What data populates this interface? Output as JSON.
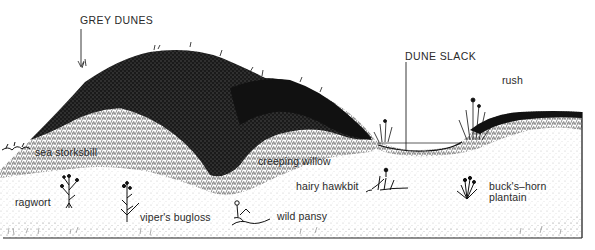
{
  "diagram": {
    "title_labels": [
      {
        "id": "grey-dunes",
        "text": "GREY DUNES"
      },
      {
        "id": "dune-slack",
        "text": "DUNE SLACK"
      }
    ],
    "plant_labels": [
      {
        "id": "rush",
        "text": "rush"
      },
      {
        "id": "sea-storksbill",
        "text": "sea storksbill"
      },
      {
        "id": "creeping-willow",
        "text": "creeping willow"
      },
      {
        "id": "ragwort",
        "text": "ragwort"
      },
      {
        "id": "hairy-hawkbit",
        "text": "hairy hawkbit"
      },
      {
        "id": "bucks-horn-plantain",
        "text": "buck's–horn",
        "text2": "plantain"
      },
      {
        "id": "vipers-bugloss",
        "text": "viper's bugloss"
      },
      {
        "id": "wild-pansy",
        "text": "wild pansy"
      }
    ],
    "colors": {
      "ink": "#111111",
      "text": "#2a2a2a",
      "paper": "#ffffff",
      "sand_speckle": "#777777"
    }
  }
}
